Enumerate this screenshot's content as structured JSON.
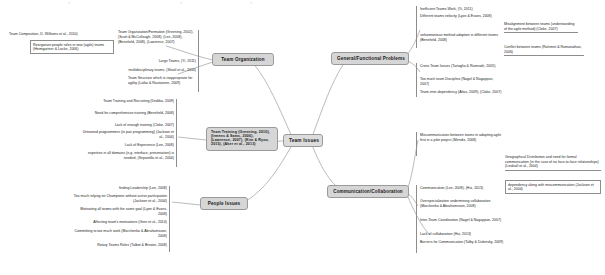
{
  "diagram": {
    "type": "mind-map",
    "title": "Team Issues",
    "central_node": {
      "label": "Team Issues"
    },
    "branches": [
      {
        "id": "team-organization",
        "label": "Team Organization"
      },
      {
        "id": "team-training",
        "label": "Team Training (Greening, 2010), (Irmens & Sams, 2006), (Lawrence, 2007), (Kim & Ryoo, 2015), (Aker et al., 2013)"
      },
      {
        "id": "people-issues",
        "label": "People Issues"
      },
      {
        "id": "general-functional-problems",
        "label": "General/Functional Problems"
      },
      {
        "id": "communication-collaboration",
        "label": "Communication/Collaboration"
      }
    ]
  },
  "left_top": {
    "group_a": {
      "heading": "Team Composition, D. Williams et al., 2010)",
      "items": [
        "Reorganize people roles in new (agile) teams (Heimgartner & Locke, 2006)"
      ]
    },
    "group_b": {
      "heading": "Team Organization/Formation (Greening, 2002), (Scott & McCullough, 2008), (Lee, 2008), (Benefield, 2008), (Lawrence, 2007)",
      "items": [
        "Large Teams, (Yi, 2011)",
        "multidisciplinary teams, (Shatil et al., 2010)",
        "Team Structure which is inappropriate for agility (Latko & Rautiainen, 2009)"
      ]
    }
  },
  "left_middle": {
    "items": [
      "Team Training and Recruiting (Drobka, 2009)",
      "Need for comprehensive training (Benefield, 2008)",
      "Lack of enough training (Cloke, 2007)",
      "Untrained programmers (in pair programming) (Jackson et al., 2004)",
      "Lack of Experience (Lee, 2008)",
      "expertise in all domains (e.g. interface, presentation) is needed, (Sirpantilla et al., 2004)"
    ]
  },
  "left_bottom": {
    "items": [
      "finding Leadership (Lee, 2008)",
      "Too much relying on Champions without active participation (Jackson et al., 2004)",
      "Motivating all teams with the same goal (Lyon & Evans, 2008)",
      "Affecting team's motivations (Gren et al., 2014)",
      "Committing to too much work (Marchenko & Abrahamsson, 2008)",
      "Rotary Teams Roles (Talbot & Brewer, 2008)"
    ]
  },
  "right_top": {
    "items": [
      "Inefficient Teams Work, (Yi, 2011)",
      "Different teams velocity (Lyon & Evans, 2008)",
      "Misalignment between teams (understanding of the agile method) (Cloke, 2007)",
      "unharmonious method adoption in different teams (Benefield, 2008)",
      "Conflict between teams (Rahimet & Ramanathan, 2006)"
    ]
  },
  "right_middle": {
    "items": [
      "Cross Team Issues (Tartaglia & Ramnath, 2005)",
      "Too much team Discipline (Nagel & Nagappan, 2007)",
      "Team inter-dependency (Atlas, 2009), (Cloke, 2007)"
    ]
  },
  "right_comm": {
    "items": [
      "Miscommunication between teams in adopting agile first in a pilot project (Mendis, 2008)",
      "Communication (Lee, 2008), (Hui, 2013)",
      "Overspecialization undermining collaboration (Marchenko & Abrahamsson, 2008)",
      "Inter-Team Coordination (Nagel & Nagappan, 2007)",
      "Lack of collaboration (Hui, 2013)",
      "Barriers for Communication (Talby & Dubinsky, 2009)"
    ]
  },
  "right_far": {
    "items": [
      "Geographical Distribution and need for formal communication (in the case of no face-to-face relationships) (Lindvall et al., 2004)",
      "dependency along with miscommunication (Jackson et al., 2004)"
    ]
  }
}
